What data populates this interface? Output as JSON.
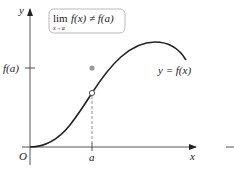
{
  "diagram": {
    "axes": {
      "y_label": "y",
      "x_label": "x",
      "origin_label": "O"
    },
    "ticks": {
      "x_tick_label": "a",
      "y_tick_label": "f(a)"
    },
    "callout": {
      "lim_word": "lim",
      "subscript": "x→a",
      "expression": "f(x) ≠ f(a)"
    },
    "curve_label": "y = f(x)",
    "points": {
      "filled_point": "(a, f(a))",
      "open_point": "limit value at x = a"
    },
    "colors": {
      "curve": "#222222",
      "axis": "#555555",
      "filled_point": "#9a9a9a",
      "callout_border": "#bbbbbb"
    }
  }
}
